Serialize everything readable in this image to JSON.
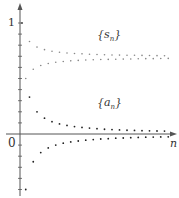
{
  "chart_data": {
    "type": "scatter",
    "title": "",
    "xlabel": "n",
    "ylabel": "",
    "y_tick_labels": [
      "0",
      "1"
    ],
    "ylim": [
      -0.55,
      1.15
    ],
    "grid": false,
    "legend": "none (inline labels)",
    "annotations": [
      "{s_n}",
      "{a_n}"
    ],
    "series": [
      {
        "name": "{a_n}",
        "formula": "a_n = (-1)^(n+1)/n",
        "x": [
          1,
          2,
          3,
          4,
          5,
          6,
          7,
          8,
          9,
          10,
          11,
          12,
          13,
          14,
          15,
          16,
          17,
          18,
          19,
          20,
          21,
          22,
          23,
          24,
          25,
          26,
          27,
          28,
          29,
          30,
          31,
          32,
          33,
          34,
          35,
          36,
          37,
          38,
          39,
          40
        ],
        "values": [
          1,
          -0.5,
          0.333,
          -0.25,
          0.2,
          -0.167,
          0.143,
          -0.125,
          0.111,
          -0.1,
          0.091,
          -0.083,
          0.077,
          -0.071,
          0.067,
          -0.063,
          0.059,
          -0.056,
          0.053,
          -0.05,
          0.048,
          -0.045,
          0.043,
          -0.042,
          0.04,
          -0.038,
          0.037,
          -0.036,
          0.034,
          -0.033,
          0.032,
          -0.031,
          0.03,
          -0.029,
          0.029,
          -0.028,
          0.027,
          -0.026,
          0.026,
          -0.025
        ]
      },
      {
        "name": "{s_n}",
        "formula": "s_n = sum_{k=1}^{n} a_k  (converges to ln 2 ≈ 0.693)",
        "x": [
          1,
          2,
          3,
          4,
          5,
          6,
          7,
          8,
          9,
          10,
          11,
          12,
          13,
          14,
          15,
          16,
          17,
          18,
          19,
          20,
          21,
          22,
          23,
          24,
          25,
          26,
          27,
          28,
          29,
          30,
          31,
          32,
          33,
          34,
          35,
          36,
          37,
          38,
          39,
          40
        ],
        "values": [
          1,
          0.5,
          0.833,
          0.583,
          0.783,
          0.617,
          0.76,
          0.635,
          0.746,
          0.646,
          0.737,
          0.653,
          0.73,
          0.659,
          0.725,
          0.663,
          0.722,
          0.666,
          0.719,
          0.669,
          0.716,
          0.671,
          0.714,
          0.672,
          0.712,
          0.674,
          0.711,
          0.675,
          0.71,
          0.676,
          0.709,
          0.678,
          0.708,
          0.679,
          0.707,
          0.679,
          0.706,
          0.68,
          0.705,
          0.681
        ]
      }
    ]
  },
  "labels": {
    "s_series": "{s",
    "s_sub": "n",
    "s_close": "}",
    "a_series": "{a",
    "a_sub": "n",
    "a_close": "}",
    "x_axis": "n",
    "origin": "0",
    "one": "1"
  },
  "colors": {
    "axis": "#555555",
    "s_points": "#888888",
    "a_points": "#222222"
  }
}
